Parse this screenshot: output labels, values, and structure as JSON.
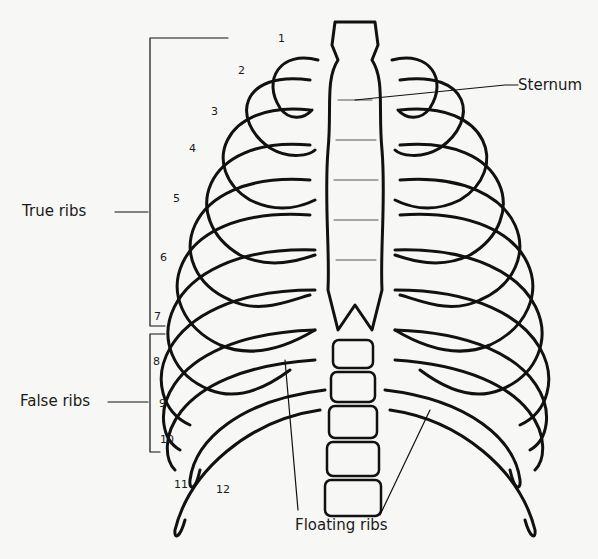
{
  "diagram": {
    "colors": {
      "background": "#f7f7f5",
      "ink": "#111111",
      "shading": "#555555"
    },
    "labels": {
      "sternum": "Sternum",
      "true_ribs": "True ribs",
      "false_ribs": "False ribs",
      "floating_ribs": "Floating ribs"
    },
    "rib_numbers": [
      "1",
      "2",
      "3",
      "4",
      "5",
      "6",
      "7",
      "8",
      "9",
      "10",
      "11",
      "12"
    ],
    "groups": [
      {
        "name": "True ribs",
        "ribs": [
          "1",
          "2",
          "3",
          "4",
          "5",
          "6",
          "7"
        ]
      },
      {
        "name": "False ribs",
        "ribs": [
          "8",
          "9",
          "10"
        ]
      },
      {
        "name": "Floating ribs",
        "ribs": [
          "11",
          "12"
        ]
      }
    ]
  }
}
